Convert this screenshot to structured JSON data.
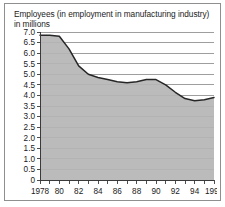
{
  "chart_data": {
    "type": "area",
    "title": "Employees (in employment in manufacturing industry) in millions",
    "title_line1": "Employees (in employment in manufacturing industry)",
    "title_line2": "in millions",
    "xlabel": "",
    "ylabel": "",
    "ylim": [
      0,
      7.0
    ],
    "xlim": [
      1978,
      1996
    ],
    "grid": true,
    "legend": "none",
    "y_ticks": [
      "0",
      "0.5",
      "1.0",
      "1.5",
      "2.0",
      "2.5",
      "3.0",
      "3.5",
      "4.0",
      "4.5",
      "5.0",
      "5.5",
      "6.0",
      "6.5",
      "7.0"
    ],
    "y_tick_values": [
      0,
      0.5,
      1.0,
      1.5,
      2.0,
      2.5,
      3.0,
      3.5,
      4.0,
      4.5,
      5.0,
      5.5,
      6.0,
      6.5,
      7.0
    ],
    "x_tick_values": [
      1978,
      1979,
      1980,
      1981,
      1982,
      1983,
      1984,
      1985,
      1986,
      1987,
      1988,
      1989,
      1990,
      1991,
      1992,
      1993,
      1994,
      1995,
      1996
    ],
    "x_tick_labels": [
      "1978",
      "",
      "80",
      "",
      "82",
      "",
      "84",
      "",
      "86",
      "",
      "88",
      "",
      "90",
      "",
      "92",
      "",
      "94",
      "",
      "1996"
    ],
    "x": [
      1978,
      1979,
      1980,
      1981,
      1982,
      1983,
      1984,
      1985,
      1986,
      1987,
      1988,
      1989,
      1990,
      1991,
      1992,
      1993,
      1994,
      1995,
      1996
    ],
    "values": [
      6.85,
      6.85,
      6.8,
      6.2,
      5.4,
      5.0,
      4.85,
      4.75,
      4.65,
      4.6,
      4.65,
      4.75,
      4.75,
      4.5,
      4.15,
      3.85,
      3.75,
      3.8,
      3.9
    ],
    "series": [
      {
        "name": "Employees in manufacturing industry (millions)",
        "values": [
          6.85,
          6.85,
          6.8,
          6.2,
          5.4,
          5.0,
          4.85,
          4.75,
          4.65,
          4.6,
          4.65,
          4.75,
          4.75,
          4.5,
          4.15,
          3.85,
          3.75,
          3.8,
          3.9
        ]
      }
    ],
    "colors": {
      "line": "#262626",
      "area_fill": "#b5b5b5",
      "grid": "#5e5e5e",
      "axis": "#3a3a3a",
      "text": "#1b1b1b",
      "card_border": "#8f8f8f",
      "background": "#ffffff"
    }
  }
}
